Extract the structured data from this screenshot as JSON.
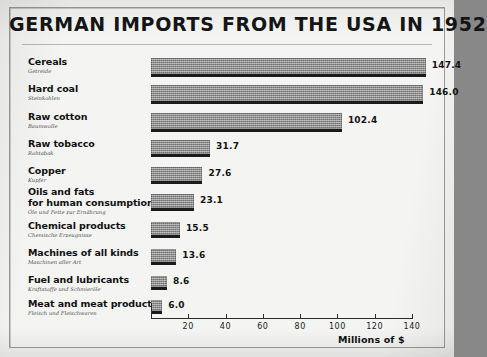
{
  "chart_data": {
    "type": "bar",
    "orientation": "horizontal",
    "title": "GERMAN IMPORTS FROM THE USA IN 1952",
    "xlabel": "Millions of $",
    "ylabel": "",
    "xlim": [
      0,
      140
    ],
    "xticks": [
      20,
      40,
      60,
      80,
      100,
      120,
      140
    ],
    "xtick_labels": [
      "20",
      "40",
      "60",
      "80",
      "100",
      "120",
      "140"
    ],
    "grid": false,
    "legend": null,
    "categories": [
      "Cereals",
      "Hard coal",
      "Raw cotton",
      "Raw tobacco",
      "Copper",
      "Oils and fats for human consumption",
      "Chemical products",
      "Machines of all kinds",
      "Fuel and lubricants",
      "Meat and meat products"
    ],
    "values": [
      147.4,
      146.0,
      102.4,
      31.7,
      27.6,
      23.1,
      15.5,
      13.6,
      8.6,
      6.0
    ],
    "value_labels": [
      "147.4",
      "146.0",
      "102.4",
      "31.7",
      "27.6",
      "23.1",
      "15.5",
      "13.6",
      "8.6",
      "6.0"
    ],
    "bars": [
      {
        "label_en_line1": "Cereals",
        "label_en_line2": "",
        "label_de": "Getreide",
        "value": 147.4,
        "value_label": "147.4"
      },
      {
        "label_en_line1": "Hard coal",
        "label_en_line2": "",
        "label_de": "Steinkohlen",
        "value": 146.0,
        "value_label": "146.0"
      },
      {
        "label_en_line1": "Raw cotton",
        "label_en_line2": "",
        "label_de": "Baumwolle",
        "value": 102.4,
        "value_label": "102.4"
      },
      {
        "label_en_line1": "Raw tobacco",
        "label_en_line2": "",
        "label_de": "Rohtabak",
        "value": 31.7,
        "value_label": "31.7"
      },
      {
        "label_en_line1": "Copper",
        "label_en_line2": "",
        "label_de": "Kupfer",
        "value": 27.6,
        "value_label": "27.6"
      },
      {
        "label_en_line1": "Oils and fats",
        "label_en_line2": "for human consumption",
        "label_de": "Öle und Fette zur Ernährung",
        "value": 23.1,
        "value_label": "23.1"
      },
      {
        "label_en_line1": "Chemical products",
        "label_en_line2": "",
        "label_de": "Chemische Erzeugnisse",
        "value": 15.5,
        "value_label": "15.5"
      },
      {
        "label_en_line1": "Machines of all kinds",
        "label_en_line2": "",
        "label_de": "Maschinen aller Art",
        "value": 13.6,
        "value_label": "13.6"
      },
      {
        "label_en_line1": "Fuel and lubricants",
        "label_en_line2": "",
        "label_de": "Kraftstoffe und Schmieröle",
        "value": 8.6,
        "value_label": "8.6"
      },
      {
        "label_en_line1": "Meat and meat products",
        "label_en_line2": "",
        "label_de": "Fleisch und Fleischwaren",
        "value": 6.0,
        "value_label": "6.0"
      }
    ]
  },
  "colors": {
    "paper": "#f4f4f2",
    "ink": "#141414",
    "bar_fill": "#8e8e8e",
    "bar_shadow": "#1b1b1b",
    "frame": "#9a9a98",
    "backdrop": "#888888"
  }
}
